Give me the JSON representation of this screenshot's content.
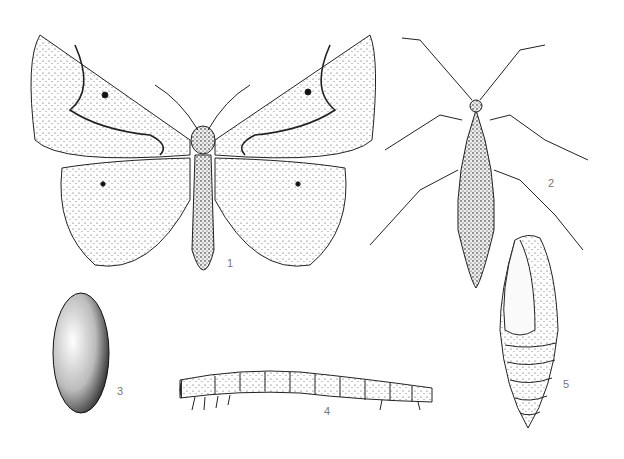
{
  "figure": {
    "labels": [
      {
        "id": "1",
        "text": "1",
        "subject": "adult male moth, wings spread"
      },
      {
        "id": "2",
        "text": "2",
        "subject": "wingless female"
      },
      {
        "id": "3",
        "text": "3",
        "subject": "egg"
      },
      {
        "id": "4",
        "text": "4",
        "subject": "larva (caterpillar)"
      },
      {
        "id": "5",
        "text": "5",
        "subject": "pupa"
      }
    ]
  }
}
